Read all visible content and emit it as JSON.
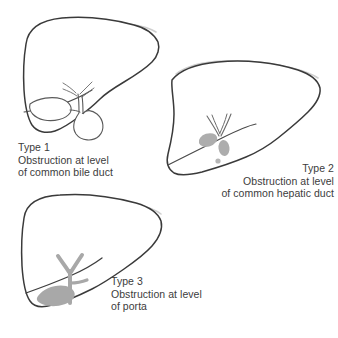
{
  "figure": {
    "background_color": "#ffffff",
    "outline_color": "#3a3a3a",
    "outline_highlight_color": "#c9c9c9",
    "duct_color": "#555555",
    "fill_gray": "#a8a8a8",
    "text_color": "#3c3c3c"
  },
  "panels": [
    {
      "id": "type-1",
      "organ": "liver",
      "finding": "dilated common bile duct with distended gallbladder",
      "label": {
        "title": "Type 1",
        "line2": "Obstruction at level",
        "line3": "of common bile duct"
      }
    },
    {
      "id": "type-2",
      "organ": "liver",
      "finding": "obstruction at common hepatic duct with collapsed gallbladder",
      "label": {
        "title": "Type 2",
        "line2": "Obstruction at level",
        "line3": "of common hepatic duct"
      }
    },
    {
      "id": "type-3",
      "organ": "liver",
      "finding": "obstruction at porta hepatis with dilated intrahepatic ducts",
      "label": {
        "title": "Type 3",
        "line2": "Obstruction at level",
        "line3": "of porta"
      }
    }
  ]
}
